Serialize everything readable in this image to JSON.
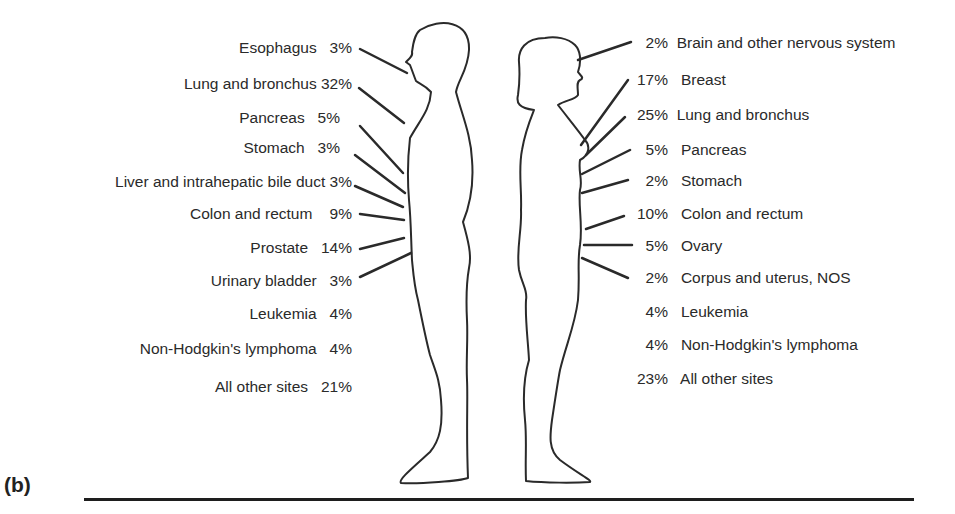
{
  "figure": {
    "panel_label": "(b)",
    "male": {
      "sex": "male",
      "sites": [
        {
          "site": "Esophagus",
          "percent": "3%"
        },
        {
          "site": "Lung and bronchus",
          "percent": "32%"
        },
        {
          "site": "Pancreas",
          "percent": "5%"
        },
        {
          "site": "Stomach",
          "percent": "3%"
        },
        {
          "site": "Liver and intrahepatic bile duct",
          "percent": "3%"
        },
        {
          "site": "Colon and rectum",
          "percent": "9%"
        },
        {
          "site": "Prostate",
          "percent": "14%"
        },
        {
          "site": "Urinary bladder",
          "percent": "3%"
        },
        {
          "site": "Leukemia",
          "percent": "4%"
        },
        {
          "site": "Non-Hodgkin's lymphoma",
          "percent": "4%"
        },
        {
          "site": "All other sites",
          "percent": "21%"
        }
      ]
    },
    "female": {
      "sex": "female",
      "sites": [
        {
          "site": "Brain and other nervous system",
          "percent": "2%"
        },
        {
          "site": "Breast",
          "percent": "17%"
        },
        {
          "site": "Lung and bronchus",
          "percent": "25%"
        },
        {
          "site": "Pancreas",
          "percent": "5%"
        },
        {
          "site": "Stomach",
          "percent": "2%"
        },
        {
          "site": "Colon and rectum",
          "percent": "10%"
        },
        {
          "site": "Ovary",
          "percent": "5%"
        },
        {
          "site": "Corpus and uterus, NOS",
          "percent": "2%"
        },
        {
          "site": "Leukemia",
          "percent": "4%"
        },
        {
          "site": "Non-Hodgkin's lymphoma",
          "percent": "4%"
        },
        {
          "site": "All other sites",
          "percent": "23%"
        }
      ]
    },
    "colors": {
      "ink": "#2a2a2a",
      "background": "#ffffff"
    }
  }
}
